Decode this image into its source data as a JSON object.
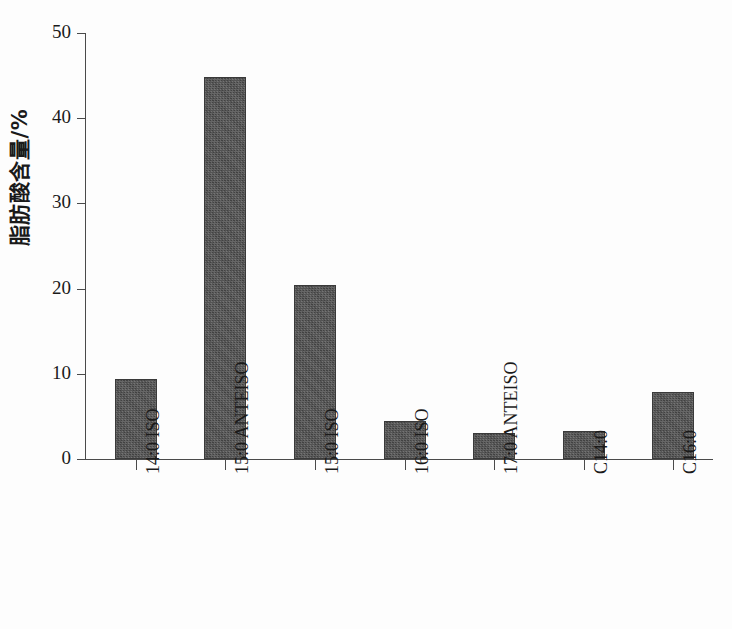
{
  "chart_data": {
    "type": "bar",
    "title": "",
    "xlabel": "",
    "ylabel": "脂肪酸含量/%",
    "categories": [
      "14:0 ISO",
      "15:0 ANTEISO",
      "15:0 ISO",
      "16:0 ISO",
      "17:0 ANTEISO",
      "C14:0",
      "C16:0"
    ],
    "values": [
      9.4,
      44.8,
      20.4,
      4.5,
      3.0,
      3.3,
      7.9
    ],
    "ylim": [
      0,
      50
    ],
    "yticks": [
      0,
      10,
      20,
      30,
      40,
      50
    ],
    "ytick_labels": [
      "0",
      "10",
      "20",
      "30",
      "40",
      "50"
    ],
    "grid": false,
    "legend": null,
    "bar_color": "#4b4b4b",
    "axis_color": "#4a4a4a",
    "background_color": "#fdfdfd"
  }
}
